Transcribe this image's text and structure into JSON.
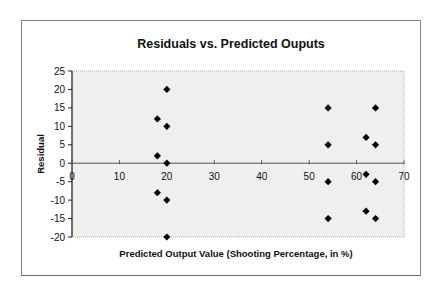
{
  "chart_data": {
    "type": "scatter",
    "title": "Residuals vs. Predicted Ouputs",
    "xlabel": "Predicted Output Value (Shooting Percentage, in %)",
    "ylabel": "Residual",
    "xlim": [
      0,
      70
    ],
    "ylim": [
      -20,
      25
    ],
    "x_ticks": [
      0,
      10,
      20,
      30,
      40,
      50,
      60,
      70
    ],
    "y_ticks": [
      25,
      20,
      15,
      10,
      5,
      0,
      -5,
      -10,
      -15,
      -20
    ],
    "grid": false,
    "legend": null,
    "plot_background": "#efefef",
    "marker": "diamond",
    "marker_color": "#000000",
    "series": [
      {
        "name": "Residuals",
        "points": [
          {
            "x": 18,
            "y": 12
          },
          {
            "x": 18,
            "y": 2
          },
          {
            "x": 18,
            "y": -8
          },
          {
            "x": 20,
            "y": 20
          },
          {
            "x": 20,
            "y": 10
          },
          {
            "x": 20,
            "y": 0
          },
          {
            "x": 20,
            "y": -10
          },
          {
            "x": 20,
            "y": -20
          },
          {
            "x": 54,
            "y": 15
          },
          {
            "x": 54,
            "y": 5
          },
          {
            "x": 54,
            "y": -5
          },
          {
            "x": 54,
            "y": -15
          },
          {
            "x": 62,
            "y": 7
          },
          {
            "x": 62,
            "y": -3
          },
          {
            "x": 62,
            "y": -13
          },
          {
            "x": 64,
            "y": 15
          },
          {
            "x": 64,
            "y": 5
          },
          {
            "x": 64,
            "y": -5
          },
          {
            "x": 64,
            "y": -15
          }
        ]
      }
    ]
  }
}
